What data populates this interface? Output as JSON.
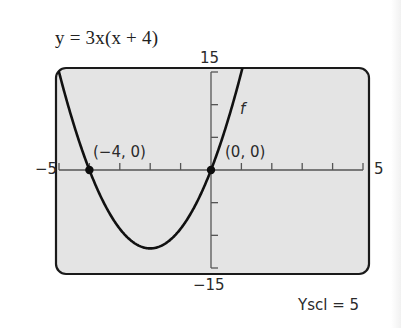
{
  "equation": "y = 3x(x + 4)",
  "window": {
    "xmin_label": "−5",
    "xmax_label": "5",
    "ymax_label": "15",
    "ymin_label": "−15",
    "yscl_label": "Yscl = 5"
  },
  "colors": {
    "screen_bg": "#e4e4e4",
    "frame": "#1a1a1a",
    "curve": "#111111",
    "axis": "#555555"
  },
  "chart_data": {
    "type": "line",
    "title": "y = 3x(x + 4)",
    "xlabel": "",
    "ylabel": "",
    "xlim": [
      -5,
      5
    ],
    "ylim": [
      -15,
      15
    ],
    "xscl": 1,
    "yscl": 5,
    "grid": false,
    "function": "3*x*(x+4)",
    "series": [
      {
        "name": "f",
        "x": [
          -5.3,
          -5,
          -4.5,
          -4,
          -3.5,
          -3,
          -2.5,
          -2,
          -1.5,
          -1,
          -0.5,
          0,
          0.3,
          0.6,
          0.9,
          1.12
        ],
        "y": [
          20.7,
          15,
          6.75,
          0,
          -5.25,
          -9,
          -11.25,
          -12,
          -11.25,
          -9,
          -5.25,
          0,
          3.87,
          8.28,
          13.23,
          17.2
        ]
      }
    ],
    "points": [
      {
        "x": -4,
        "y": 0,
        "label": "(−4, 0)"
      },
      {
        "x": 0,
        "y": 0,
        "label": "(0, 0)"
      }
    ],
    "annotations": [
      {
        "text": "f",
        "x": 0.35,
        "y": 6.5
      }
    ]
  }
}
